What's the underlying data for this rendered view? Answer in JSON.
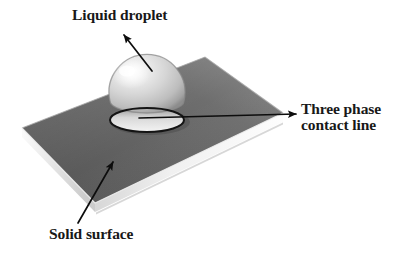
{
  "figure": {
    "type": "diagram",
    "background_color": "#ffffff"
  },
  "labels": {
    "liquid_droplet": "Liquid droplet",
    "three_phase_line1": "Three phase",
    "three_phase_line2": "contact line",
    "solid_surface": "Solid surface"
  },
  "colors": {
    "text": "#181818",
    "arrow": "#0d0d0d",
    "plate_top_dark": "#5d5d5d",
    "plate_top_light": "#8a8a8a",
    "plate_edge_light": "#f2f2f2",
    "plate_edge_shadow": "#b9b9b9",
    "droplet_light": "#f0f0f0",
    "droplet_mid": "#c7c7c7",
    "droplet_dark": "#8f8f8f",
    "contact_line": "#141414"
  },
  "geometry": {
    "plate_corners": {
      "left": [
        22,
        128
      ],
      "top": [
        205,
        57
      ],
      "right": [
        283,
        113
      ],
      "bottom": [
        95,
        203
      ]
    },
    "plate_thickness_px": 9,
    "droplet_center": [
      147,
      90
    ],
    "droplet_radius_px": 38,
    "contact_ellipse_center": [
      147,
      120
    ],
    "contact_ellipse_rx": 37,
    "contact_ellipse_ry": 12
  },
  "annotations": [
    {
      "name": "liquid-droplet-arrow",
      "from": [
        152,
        70
      ],
      "to": [
        124,
        34
      ],
      "points_at": "droplet"
    },
    {
      "name": "three-phase-contact-line-arrow",
      "from": [
        139,
        118
      ],
      "to": [
        296,
        114
      ],
      "points_at": "contact-line-label"
    },
    {
      "name": "solid-surface-arrow",
      "from": [
        78,
        224
      ],
      "to": [
        113,
        162
      ],
      "points_at": "plate-surface"
    }
  ]
}
